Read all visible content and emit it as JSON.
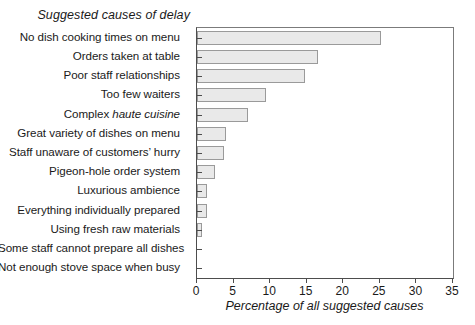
{
  "chart_data": {
    "type": "bar",
    "orientation": "horizontal",
    "title": "Suggested causes of delay",
    "xlabel": "Percentage of all suggested causes",
    "ylabel": "",
    "xlim": [
      0,
      35
    ],
    "xticks": [
      0,
      5,
      10,
      15,
      20,
      25,
      30,
      35
    ],
    "xtick_labels": [
      "0",
      "5",
      "10",
      "15",
      "20",
      "25",
      "30",
      "35"
    ],
    "grid": false,
    "legend": null,
    "bar_fill_color": "#e9e9e9",
    "bar_edge_color": "#9a9a9a",
    "categories": [
      "No dish cooking times on menu",
      "Orders taken at table",
      "Poor staff relationships",
      "Too few waiters",
      "Complex haute cuisine",
      "Great variety of dishes on menu",
      "Staff unaware of customers' hurry",
      "Pigeon-hole order system",
      "Luxurious ambience",
      "Everything individually prepared",
      "Using fresh raw materials",
      "Some staff cannot prepare all dishes",
      "Not enough stove space when busy"
    ],
    "values": [
      25.1,
      16.6,
      14.8,
      9.4,
      7.0,
      3.9,
      3.7,
      2.5,
      1.3,
      1.3,
      0.7,
      0.0,
      0.0
    ]
  },
  "labels": {
    "header": "Suggested causes of delay",
    "axis_title": "Percentage of all suggested causes",
    "rows": [
      {
        "pre": "No dish cooking times on menu",
        "italic": "",
        "post": ""
      },
      {
        "pre": "Orders taken at table",
        "italic": "",
        "post": ""
      },
      {
        "pre": "Poor staff relationships",
        "italic": "",
        "post": ""
      },
      {
        "pre": "Too few waiters",
        "italic": "",
        "post": ""
      },
      {
        "pre": "Complex ",
        "italic": "haute cuisine",
        "post": ""
      },
      {
        "pre": "Great variety of dishes on menu",
        "italic": "",
        "post": ""
      },
      {
        "pre": "Staff unaware of customers’ hurry",
        "italic": "",
        "post": ""
      },
      {
        "pre": "Pigeon-hole order system",
        "italic": "",
        "post": ""
      },
      {
        "pre": "Luxurious ambience",
        "italic": "",
        "post": ""
      },
      {
        "pre": "Everything individually prepared",
        "italic": "",
        "post": ""
      },
      {
        "pre": "Using fresh raw materials",
        "italic": "",
        "post": ""
      },
      {
        "pre": "Some staff cannot prepare all dishes",
        "italic": "",
        "post": ""
      },
      {
        "pre": "Not enough stove space when busy",
        "italic": "",
        "post": ""
      }
    ]
  }
}
